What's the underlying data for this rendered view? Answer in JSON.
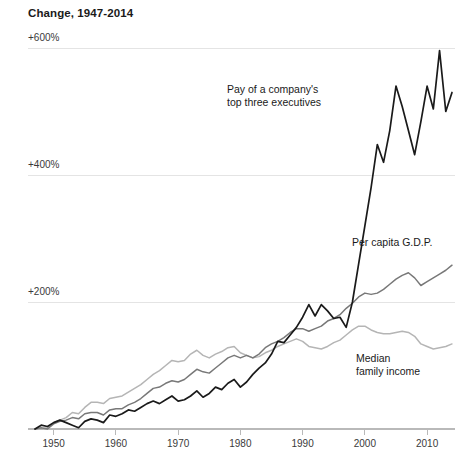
{
  "chart_data": {
    "type": "line",
    "title": "Change, 1947-2014",
    "xlabel": "",
    "ylabel": "",
    "xlim": [
      1947,
      2014
    ],
    "ylim": [
      0,
      620
    ],
    "grid": true,
    "legend_position": "inline-annotations",
    "x_ticks": [
      "1950",
      "1960",
      "1970",
      "1980",
      "1990",
      "2000",
      "2010"
    ],
    "x_tick_values": [
      1950,
      1960,
      1970,
      1980,
      1990,
      2000,
      2010
    ],
    "y_ticks": [
      "+200%",
      "+400%",
      "+600%"
    ],
    "y_tick_values": [
      200,
      400,
      600
    ],
    "annotations": [
      {
        "name": "exec-pay",
        "line1": "Pay of a company's",
        "line2": "top three executives",
        "x": 227,
        "y": 93
      },
      {
        "name": "gdp",
        "line1": "Per capita G.D.P.",
        "line2": "",
        "x": 352,
        "y": 246
      },
      {
        "name": "median-income",
        "line1": "Median",
        "line2": "family income",
        "x": 356,
        "y": 362
      }
    ],
    "series": [
      {
        "name": "Pay of a company's top three executives",
        "color": "#1a1a1a",
        "width": 1.7,
        "x": [
          1947,
          1948,
          1949,
          1950,
          1951,
          1952,
          1953,
          1954,
          1955,
          1956,
          1957,
          1958,
          1959,
          1960,
          1961,
          1962,
          1963,
          1964,
          1965,
          1966,
          1967,
          1968,
          1969,
          1970,
          1971,
          1972,
          1973,
          1974,
          1975,
          1976,
          1977,
          1978,
          1979,
          1980,
          1981,
          1982,
          1983,
          1984,
          1985,
          1986,
          1987,
          1988,
          1989,
          1990,
          1991,
          1992,
          1993,
          1994,
          1995,
          1996,
          1997,
          1998,
          1999,
          2000,
          2001,
          2002,
          2003,
          2004,
          2005,
          2006,
          2007,
          2008,
          2009,
          2010,
          2011,
          2012,
          2013,
          2014
        ],
        "values": [
          0,
          6,
          4,
          10,
          14,
          10,
          6,
          2,
          12,
          16,
          14,
          10,
          22,
          20,
          24,
          30,
          28,
          34,
          40,
          44,
          40,
          46,
          52,
          44,
          46,
          52,
          60,
          50,
          56,
          66,
          62,
          72,
          78,
          66,
          74,
          86,
          96,
          104,
          118,
          138,
          136,
          148,
          160,
          176,
          196,
          178,
          196,
          186,
          174,
          176,
          160,
          200,
          260,
          320,
          380,
          448,
          420,
          470,
          540,
          508,
          470,
          432,
          484,
          540,
          504,
          596,
          500,
          530
        ]
      },
      {
        "name": "Per capita G.D.P.",
        "color": "#787878",
        "width": 1.5,
        "x": [
          1947,
          1948,
          1949,
          1950,
          1951,
          1952,
          1953,
          1954,
          1955,
          1956,
          1957,
          1958,
          1959,
          1960,
          1961,
          1962,
          1963,
          1964,
          1965,
          1966,
          1967,
          1968,
          1969,
          1970,
          1971,
          1972,
          1973,
          1974,
          1975,
          1976,
          1977,
          1978,
          1979,
          1980,
          1981,
          1982,
          1983,
          1984,
          1985,
          1986,
          1987,
          1988,
          1989,
          1990,
          1991,
          1992,
          1993,
          1994,
          1995,
          1996,
          1997,
          1998,
          1999,
          2000,
          2001,
          2002,
          2003,
          2004,
          2005,
          2006,
          2007,
          2008,
          2009,
          2010,
          2011,
          2012,
          2013,
          2014
        ],
        "values": [
          0,
          2,
          0,
          8,
          12,
          14,
          18,
          16,
          24,
          26,
          26,
          22,
          30,
          32,
          32,
          38,
          42,
          48,
          56,
          64,
          66,
          72,
          76,
          74,
          78,
          86,
          94,
          90,
          88,
          96,
          104,
          112,
          116,
          112,
          116,
          112,
          118,
          128,
          134,
          138,
          144,
          152,
          158,
          158,
          154,
          158,
          162,
          170,
          174,
          180,
          190,
          198,
          208,
          214,
          212,
          214,
          220,
          228,
          236,
          242,
          246,
          238,
          226,
          232,
          238,
          244,
          250,
          258
        ]
      },
      {
        "name": "Median family income",
        "color": "#b5b5b5",
        "width": 1.5,
        "x": [
          1947,
          1948,
          1949,
          1950,
          1951,
          1952,
          1953,
          1954,
          1955,
          1956,
          1957,
          1958,
          1959,
          1960,
          1961,
          1962,
          1963,
          1964,
          1965,
          1966,
          1967,
          1968,
          1969,
          1970,
          1971,
          1972,
          1973,
          1974,
          1975,
          1976,
          1977,
          1978,
          1979,
          1980,
          1981,
          1982,
          1983,
          1984,
          1985,
          1986,
          1987,
          1988,
          1989,
          1990,
          1991,
          1992,
          1993,
          1994,
          1995,
          1996,
          1997,
          1998,
          1999,
          2000,
          2001,
          2002,
          2003,
          2004,
          2005,
          2006,
          2007,
          2008,
          2009,
          2010,
          2011,
          2012,
          2013,
          2014
        ],
        "values": [
          0,
          0,
          2,
          10,
          14,
          18,
          26,
          24,
          34,
          42,
          42,
          40,
          48,
          50,
          52,
          58,
          64,
          70,
          78,
          86,
          92,
          100,
          108,
          106,
          108,
          118,
          124,
          116,
          112,
          118,
          122,
          128,
          130,
          120,
          116,
          112,
          114,
          120,
          124,
          130,
          134,
          138,
          142,
          138,
          130,
          128,
          126,
          130,
          136,
          140,
          148,
          156,
          162,
          162,
          156,
          152,
          150,
          150,
          152,
          154,
          152,
          146,
          134,
          130,
          126,
          128,
          130,
          134
        ]
      }
    ]
  }
}
